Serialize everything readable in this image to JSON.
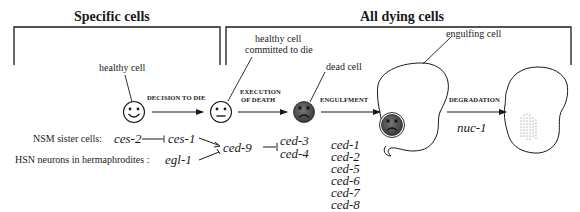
{
  "sections": {
    "specific": {
      "title": "Specific cells"
    },
    "all_dying": {
      "title": "All dying cells"
    }
  },
  "cells": {
    "healthy": "healthy cell",
    "committed": [
      "healthy cell",
      "committed to die"
    ],
    "dead": "dead cell",
    "engulfing": "engulfing cell"
  },
  "steps": {
    "decision": "DECISION TO DIE",
    "execution": [
      "EXECUTION",
      "OF DEATH"
    ],
    "engulfment": "ENGULFMENT",
    "degradation": "DEGRADATION"
  },
  "regulation": {
    "nsm_label": "NSM sister cells:",
    "hsn_label": "HSN neurons in hermaphrodites :",
    "ces2": "ces-2",
    "ces1": "ces-1",
    "egl1": "egl-1",
    "ced9": "ced-9",
    "ced3": "ced-3",
    "ced4": "ced-4"
  },
  "engulfment_genes": [
    "ced-1",
    "ced-2",
    "ced-5",
    "ced-6",
    "ced-7",
    "ced-8",
    "ced-10"
  ],
  "degradation_gene": "nuc-1",
  "colors": {
    "ink": "#1a1a1a",
    "dead_cell_fill": "#4a4a4a",
    "face_fill": "#ffffff"
  }
}
